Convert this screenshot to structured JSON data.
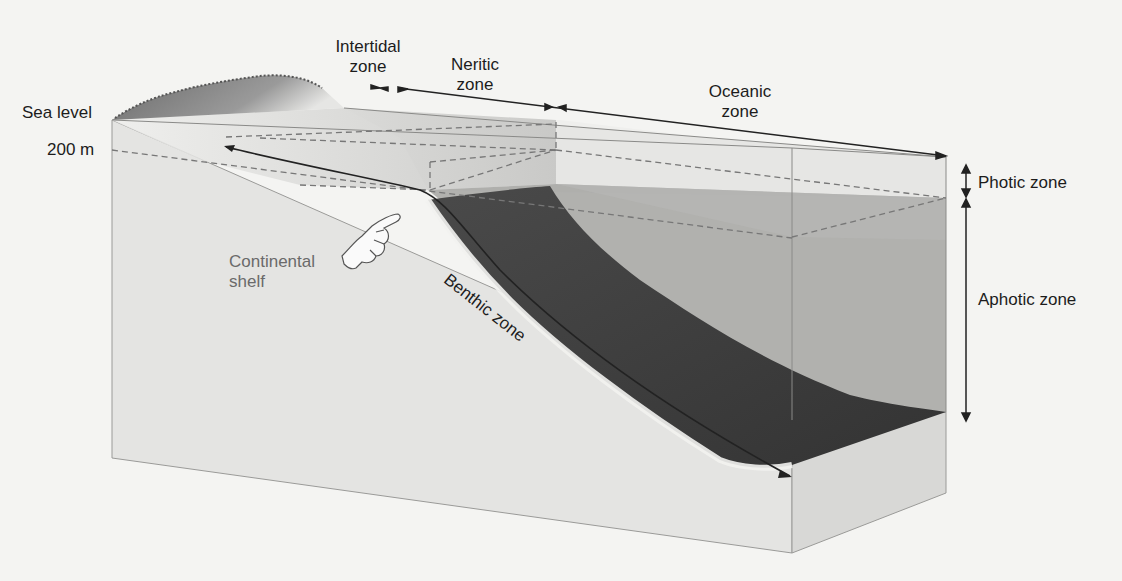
{
  "diagram": {
    "labels": {
      "sea_level": "Sea level",
      "depth_200m": "200 m",
      "intertidal_line1": "Intertidal",
      "intertidal_line2": "zone",
      "neritic_line1": "Neritic",
      "neritic_line2": "zone",
      "oceanic_line1": "Oceanic",
      "oceanic_line2": "zone",
      "photic": "Photic zone",
      "aphotic": "Aphotic zone",
      "continental_line1": "Continental",
      "continental_line2": "shelf",
      "benthic": "Benthic zone"
    },
    "icons": {
      "pointer": "pointing-hand-icon",
      "arrows": "double-arrow-icon"
    },
    "colors": {
      "background": "#f4f4f2",
      "block_front": "#e2e2e0",
      "block_side": "#d6d6d4",
      "water_top": "#ececea",
      "photic_water": "#d9d9d7",
      "aphotic_water": "#9e9e9c",
      "seafloor": "#3e3e3e",
      "land": "#6e6e6e",
      "line": "#222222",
      "dashed": "#777777"
    }
  }
}
